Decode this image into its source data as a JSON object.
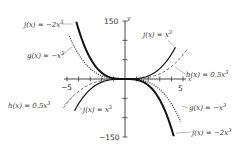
{
  "chart_data": {
    "type": "line",
    "title": "",
    "xlabel": "x",
    "ylabel": "y",
    "xlim": [
      -5.2,
      5.2
    ],
    "ylim": [
      -150,
      150
    ],
    "x_ticks": [
      -5,
      -4,
      -3,
      -2,
      -1,
      1,
      2,
      3,
      4,
      5
    ],
    "x_tick_labels": {
      "-5": "-5",
      "5": "5"
    },
    "y_ticks": [
      -150,
      -100,
      -50,
      50,
      100,
      150
    ],
    "y_tick_labels": {
      "150": "150",
      "-150": "-150"
    },
    "grid": false,
    "series": [
      {
        "name": "f(x) = x^3",
        "label": "f(x) = x³",
        "coef": 1,
        "style": "solid",
        "width": 1.2,
        "x_range": [
          -4.35,
          4.35
        ]
      },
      {
        "name": "g(x) = -x^3",
        "label": "g(x) = −x³",
        "coef": -1,
        "style": "dotted",
        "width": 1.4,
        "x_range": [
          -4.8,
          4.8
        ]
      },
      {
        "name": "h(x) = 0.5x^3",
        "label": "h(x) = 0.5x³",
        "coef": 0.5,
        "style": "dashed",
        "width": 0.8,
        "x_range": [
          -5.3,
          5.3
        ]
      },
      {
        "name": "j(x) = -2x^3",
        "label": "j(x) = −2x³",
        "coef": -2,
        "style": "solid",
        "width": 2,
        "x_range": [
          -4.2,
          4.2
        ]
      }
    ],
    "annotations": [
      {
        "text": "j(x) = −2x³",
        "x": 22,
        "y": 25,
        "target": [
          73,
          24
        ]
      },
      {
        "text": "g(x) = −x³",
        "x": 28,
        "y": 57,
        "target": [
          72,
          47
        ]
      },
      {
        "text": "j(x) = x³",
        "x": 145,
        "y": 38,
        "target": [
          176,
          49
        ]
      },
      {
        "text": "h(x) = 0.5x³",
        "x": 185,
        "y": 75,
        "target": [
          175,
          67
        ]
      },
      {
        "text": "h(x) = 0.5x³",
        "x": 8,
        "y": 104,
        "target": [
          74,
          95
        ]
      },
      {
        "text": "j(x) = x³",
        "x": 83,
        "y": 110,
        "target": [
          77,
          106
        ]
      },
      {
        "text": "g(x) = −x³",
        "x": 188,
        "y": 108,
        "target": [
          182,
          106
        ]
      },
      {
        "text": "j(x) = −2x³",
        "x": 192,
        "y": 133,
        "target": [
          176,
          133
        ]
      }
    ]
  },
  "labels": {
    "y_axis": "y",
    "x_axis": "x",
    "y_top": "150",
    "y_bottom": "−150",
    "x_left": "−5",
    "x_right": "5",
    "ann_j_neg2_top": "j(x) = −2x",
    "ann_g_top": "g(x) = −x",
    "ann_j_top": "j(x) = x",
    "ann_h_right": "h(x) = 0.5x",
    "ann_h_left": "h(x) = 0.5x",
    "ann_j_bottom": "j(x) = x",
    "ann_g_bottom": "g(x) = −x",
    "ann_j_neg2_bottom": "j(x) = −2x",
    "cube": "3"
  }
}
